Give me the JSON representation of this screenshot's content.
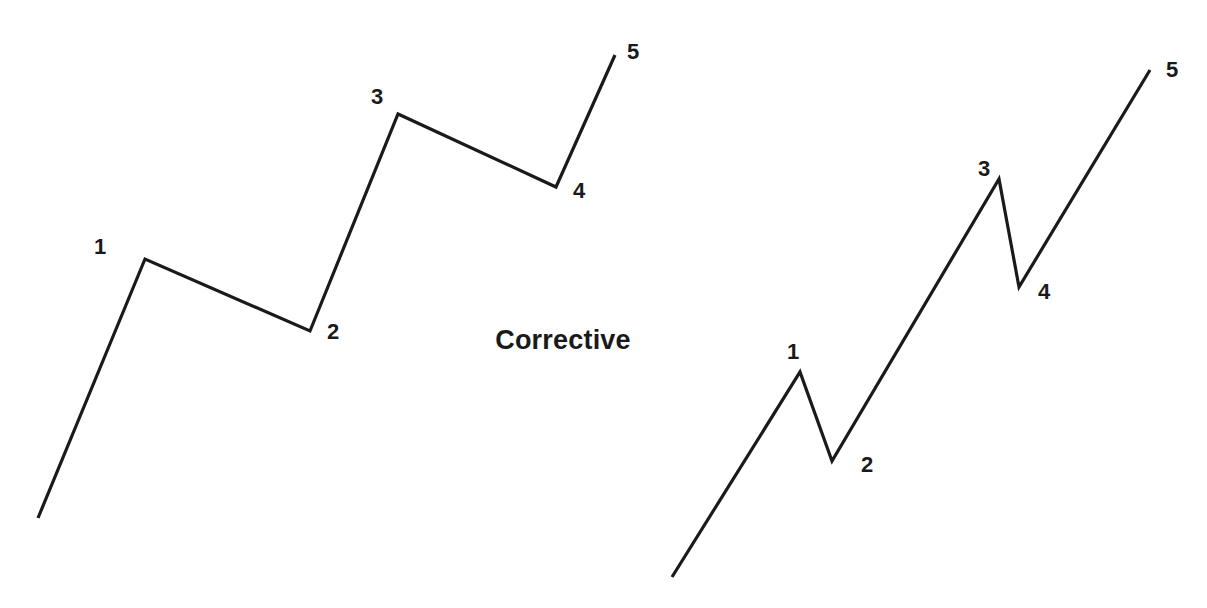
{
  "figure": {
    "background_color": "#ffffff",
    "line_color": "#1a1a1a",
    "width": 1207,
    "height": 608
  },
  "caption": {
    "text": "Corrective",
    "x": 563,
    "y": 340
  },
  "chart_data": {
    "type": "line",
    "title": "",
    "subtitle": "",
    "xlabel": "",
    "ylabel": "",
    "grid": false,
    "legend": null,
    "axis_visible": false,
    "annotations": [
      "Corrective"
    ],
    "series": [
      {
        "name": "left-wave",
        "point_labels": [
          "",
          "1",
          "2",
          "3",
          "4",
          "5"
        ],
        "x": [
          38,
          145,
          310,
          398,
          556,
          615
        ],
        "y": [
          518,
          259,
          331,
          114,
          187,
          55
        ]
      },
      {
        "name": "right-wave",
        "point_labels": [
          "",
          "1",
          "2",
          "3",
          "4",
          "5"
        ],
        "x": [
          672,
          800,
          832,
          999,
          1019,
          1150
        ],
        "y": [
          577,
          372,
          461,
          179,
          287,
          70
        ]
      }
    ],
    "xlim": [
      0,
      1207
    ],
    "ylim": [
      608,
      0
    ]
  },
  "left_wave": {
    "path": "M 38 518 L 145 259 L 310 331 L 398 114 L 556 187 L 615 55",
    "labels": [
      {
        "text": "1",
        "x": 100,
        "y": 247
      },
      {
        "text": "2",
        "x": 333,
        "y": 332
      },
      {
        "text": "3",
        "x": 377,
        "y": 97
      },
      {
        "text": "4",
        "x": 579,
        "y": 191
      },
      {
        "text": "5",
        "x": 633,
        "y": 52
      }
    ]
  },
  "right_wave": {
    "path": "M 672 577 L 800 372 L 832 461 L 999 179 L 1019 287 L 1150 70",
    "labels": [
      {
        "text": "1",
        "x": 793,
        "y": 352
      },
      {
        "text": "2",
        "x": 867,
        "y": 465
      },
      {
        "text": "3",
        "x": 984,
        "y": 169
      },
      {
        "text": "4",
        "x": 1044,
        "y": 292
      },
      {
        "text": "5",
        "x": 1172,
        "y": 70
      }
    ]
  }
}
